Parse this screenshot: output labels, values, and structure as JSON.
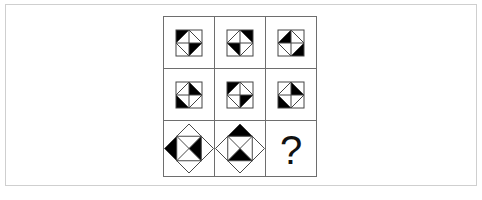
{
  "puzzle": {
    "type": "3x3 visual reasoning matrix",
    "colors": {
      "fill": "#000000",
      "stroke": "#444444",
      "grid_border": "#6e6e6e",
      "frame_border": "#cfcfcf"
    },
    "cells": [
      {
        "row": 1,
        "col": 1,
        "shape": "square-with-diamond-cross",
        "filled": [
          "outer-top-left",
          "inner-bottom-right"
        ]
      },
      {
        "row": 1,
        "col": 2,
        "shape": "square-with-diamond-cross",
        "filled": [
          "outer-top-right",
          "inner-bottom-left"
        ]
      },
      {
        "row": 1,
        "col": 3,
        "shape": "square-with-diamond-cross",
        "filled": [
          "inner-top-left",
          "outer-bottom-right"
        ]
      },
      {
        "row": 2,
        "col": 1,
        "shape": "square-with-diamond-cross",
        "filled": [
          "inner-top-right",
          "outer-bottom-left"
        ]
      },
      {
        "row": 2,
        "col": 2,
        "shape": "square-with-diamond-cross",
        "filled": [
          "outer-top-left",
          "inner-bottom-right"
        ]
      },
      {
        "row": 2,
        "col": 3,
        "shape": "square-with-diamond-cross",
        "filled": [
          "inner-top-right",
          "outer-bottom-left"
        ]
      },
      {
        "row": 3,
        "col": 1,
        "shape": "diamond-with-square-x",
        "filled": [
          "outer-left",
          "inner-right"
        ]
      },
      {
        "row": 3,
        "col": 2,
        "shape": "diamond-with-square-x",
        "filled": [
          "outer-top",
          "inner-bottom"
        ]
      },
      {
        "row": 3,
        "col": 3,
        "shape": "unknown",
        "label": "?"
      }
    ]
  }
}
